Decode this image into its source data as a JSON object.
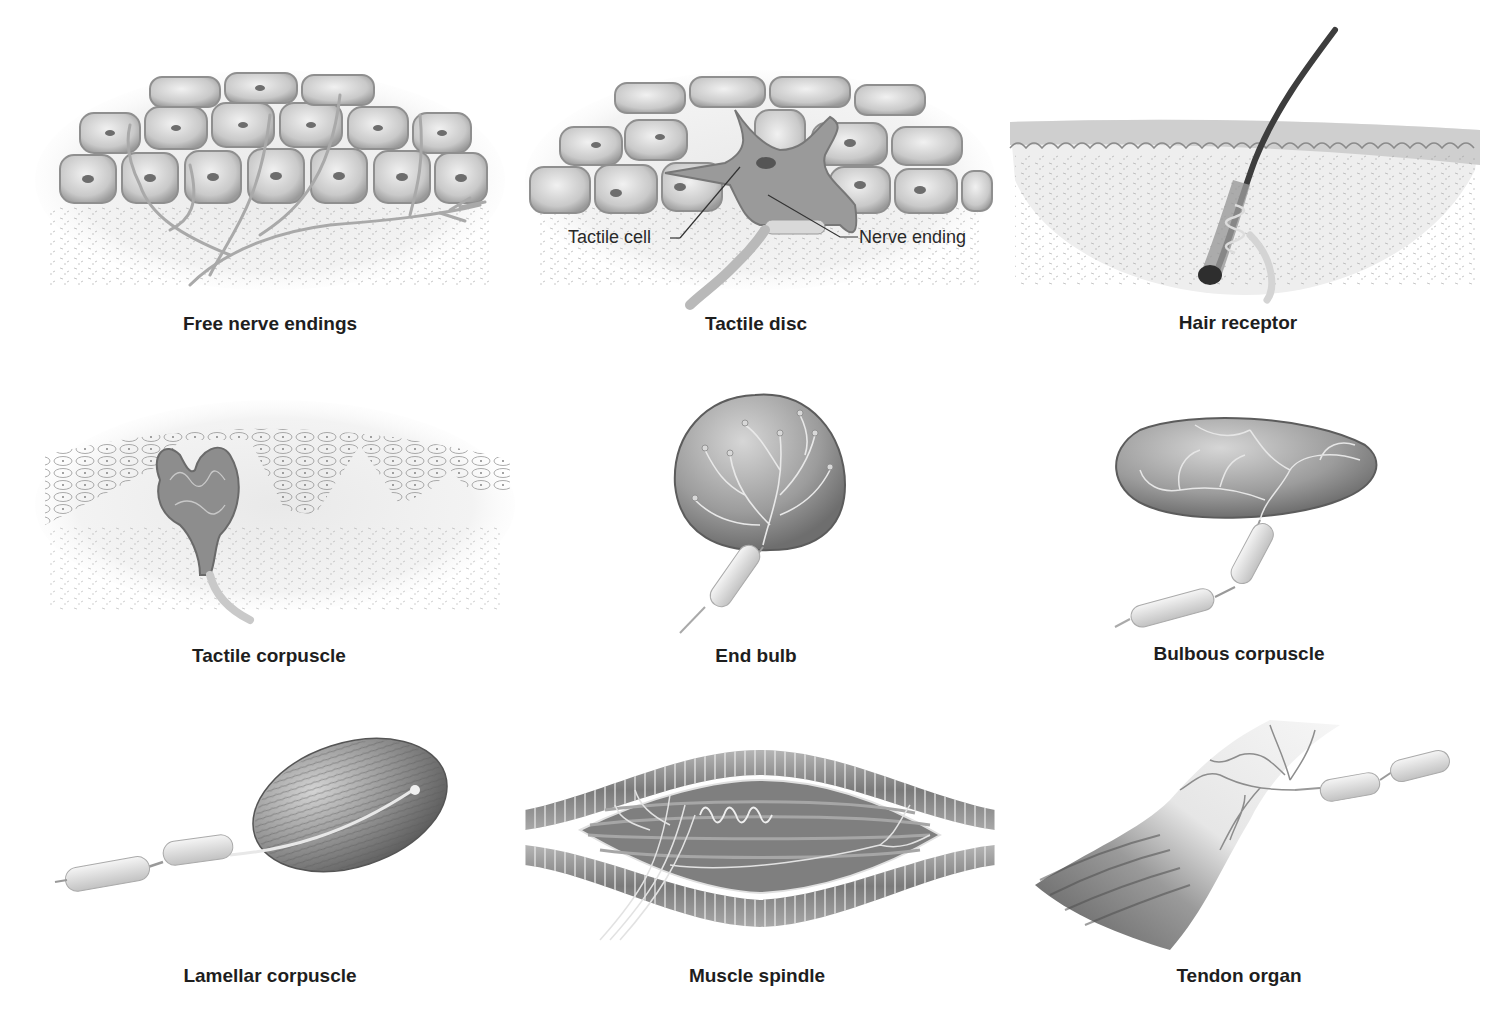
{
  "figure": {
    "background": "#ffffff",
    "caption_color": "#1e1e1e",
    "panels": [
      {
        "id": "free-nerve-endings",
        "caption": "Free nerve endings",
        "row": 1,
        "col": 1
      },
      {
        "id": "tactile-disc",
        "caption": "Tactile disc",
        "row": 1,
        "col": 2,
        "callouts": [
          {
            "label": "Tactile cell"
          },
          {
            "label": "Nerve ending"
          }
        ]
      },
      {
        "id": "hair-receptor",
        "caption": "Hair receptor",
        "row": 1,
        "col": 3
      },
      {
        "id": "tactile-corpuscle",
        "caption": "Tactile corpuscle",
        "row": 2,
        "col": 1
      },
      {
        "id": "end-bulb",
        "caption": "End bulb",
        "row": 2,
        "col": 2
      },
      {
        "id": "bulbous-corpuscle",
        "caption": "Bulbous corpuscle",
        "row": 2,
        "col": 3
      },
      {
        "id": "lamellar-corpuscle",
        "caption": "Lamellar corpuscle",
        "row": 3,
        "col": 1
      },
      {
        "id": "muscle-spindle",
        "caption": "Muscle spindle",
        "row": 3,
        "col": 2
      },
      {
        "id": "tendon-organ",
        "caption": "Tendon organ",
        "row": 3,
        "col": 3
      }
    ]
  }
}
